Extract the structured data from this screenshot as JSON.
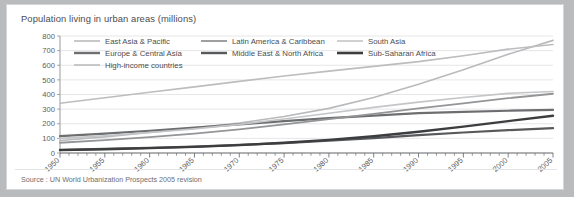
{
  "figure": {
    "title": "Population living in urban areas (millions)",
    "source": "Source : UN World Urbanization Prospects 2005 revision"
  },
  "chart_data": {
    "type": "line",
    "title": "Population living in urban areas (millions)",
    "xlabel": "",
    "ylabel": "",
    "xlim": [
      1950,
      2005
    ],
    "ylim": [
      0,
      800
    ],
    "yticks": [
      0,
      100,
      200,
      300,
      400,
      500,
      600,
      700,
      800
    ],
    "xticks": [
      1950,
      1955,
      1960,
      1965,
      1970,
      1975,
      1980,
      1985,
      1990,
      1995,
      2000,
      2005
    ],
    "grid": true,
    "legend_position": "top",
    "x": [
      1950,
      1955,
      1960,
      1965,
      1970,
      1975,
      1980,
      1985,
      1990,
      1995,
      2000,
      2005
    ],
    "series": [
      {
        "name": "East Asia & Pacific",
        "color": "#b9babc",
        "width": 1.6,
        "values": [
          85,
          110,
          140,
          170,
          205,
          250,
          305,
          380,
          470,
          570,
          675,
          770
        ]
      },
      {
        "name": "Europe & Central Asia",
        "color": "#6d6e70",
        "width": 2.2,
        "values": [
          115,
          132,
          152,
          173,
          196,
          218,
          238,
          255,
          272,
          281,
          289,
          295
        ]
      },
      {
        "name": "High-income countries",
        "color": "#bcbdbf",
        "width": 1.6,
        "values": [
          340,
          378,
          415,
          452,
          490,
          526,
          560,
          592,
          625,
          665,
          710,
          742
        ]
      },
      {
        "name": "Latin America & Caribbean",
        "color": "#949597",
        "width": 1.8,
        "values": [
          70,
          88,
          108,
          132,
          162,
          196,
          232,
          268,
          305,
          340,
          375,
          405
        ]
      },
      {
        "name": "Middle East & North Africa",
        "color": "#58595b",
        "width": 2.2,
        "values": [
          22,
          28,
          35,
          44,
          55,
          68,
          84,
          102,
          122,
          140,
          156,
          170
        ]
      },
      {
        "name": "South Asia",
        "color": "#c4c5c7",
        "width": 1.6,
        "values": [
          100,
          118,
          140,
          165,
          196,
          232,
          272,
          312,
          348,
          380,
          408,
          420
        ]
      },
      {
        "name": "Sub-Saharan Africa",
        "color": "#3c3d3f",
        "width": 2.4,
        "values": [
          20,
          26,
          33,
          42,
          54,
          70,
          90,
          115,
          145,
          180,
          218,
          255
        ]
      }
    ],
    "legend": [
      {
        "label": "East Asia & Pacific",
        "color": "#b9babc",
        "width": 1.6,
        "col": 0,
        "row": 0
      },
      {
        "label": "Latin America & Caribbean",
        "color": "#949597",
        "width": 1.8,
        "col": 1,
        "row": 0
      },
      {
        "label": "South Asia",
        "color": "#c4c5c7",
        "width": 1.6,
        "col": 2,
        "row": 0
      },
      {
        "label": "Europe & Central Asia",
        "color": "#6d6e70",
        "width": 2.4,
        "col": 0,
        "row": 1
      },
      {
        "label": "Middle East & North Africa",
        "color": "#58595b",
        "width": 2.4,
        "col": 1,
        "row": 1
      },
      {
        "label": "Sub-Saharan Africa",
        "color": "#3c3d3f",
        "width": 2.6,
        "col": 2,
        "row": 1
      },
      {
        "label": "High-income countries",
        "color": "#bcbdbf",
        "width": 1.6,
        "col": 0,
        "row": 2
      }
    ]
  }
}
